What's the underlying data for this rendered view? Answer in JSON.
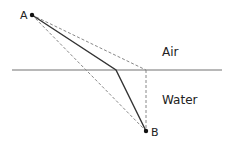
{
  "diagram": {
    "type": "refraction-path",
    "points": {
      "A": {
        "label": "A",
        "x": 32,
        "y": 15
      },
      "B": {
        "label": "B",
        "x": 146,
        "y": 131
      },
      "refraction_point": {
        "x": 116,
        "y": 70
      },
      "surface_below_A_side": {
        "x": 146,
        "y": 70
      }
    },
    "interface": {
      "x1": 12,
      "x2": 222,
      "y": 70,
      "color": "#a0a0a0"
    },
    "media": {
      "upper": {
        "label": "Air",
        "x": 162,
        "y": 56
      },
      "lower": {
        "label": "Water",
        "x": 162,
        "y": 104
      }
    },
    "colors": {
      "solid_path": "#333333",
      "dashed_paths": "#888888",
      "points": "#111111"
    }
  }
}
